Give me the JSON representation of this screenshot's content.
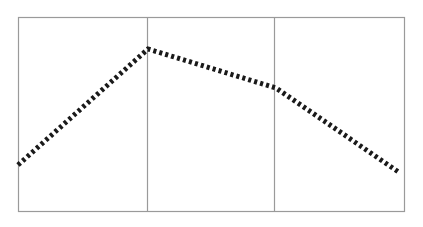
{
  "page": {
    "background_color": "#ffffff",
    "width": 423,
    "height": 227
  },
  "chart_data": {
    "type": "line",
    "title": "",
    "subtitle": "",
    "xlabel": "",
    "ylabel": "",
    "grid": true,
    "legend": null,
    "legend_position": "none",
    "axis_ticks_visible": false,
    "tick_labels_x": [],
    "tick_labels_y": [],
    "xlim": [
      0,
      3
    ],
    "ylim": [
      0,
      1
    ],
    "x": [
      0.0,
      1.0,
      2.0,
      2.95
    ],
    "y": [
      0.236,
      0.837,
      0.636,
      0.196
    ],
    "series": [
      {
        "name": "series-1",
        "x": [
          0.0,
          1.0,
          2.0,
          2.95
        ],
        "y": [
          0.236,
          0.837,
          0.636,
          0.196
        ],
        "line_style": "dashed",
        "line_width": 5,
        "color": "#1a1a1a",
        "marker": "none"
      }
    ],
    "gridlines_x": [
      1.0,
      2.0
    ],
    "gridline_color": "#9a9a9a",
    "frame_color": "#9a9a9a",
    "annotations": []
  },
  "plot_geometry": {
    "frame": {
      "left": 18,
      "top": 17,
      "right": 404,
      "bottom": 211
    },
    "dividers_x": [
      147,
      274
    ],
    "polyline_points": "18,165 148,49 276,88 400,173"
  },
  "colors": {
    "frame": "#9a9a9a",
    "divider": "#9a9a9a",
    "line": "#1a1a1a",
    "background": "#ffffff"
  }
}
